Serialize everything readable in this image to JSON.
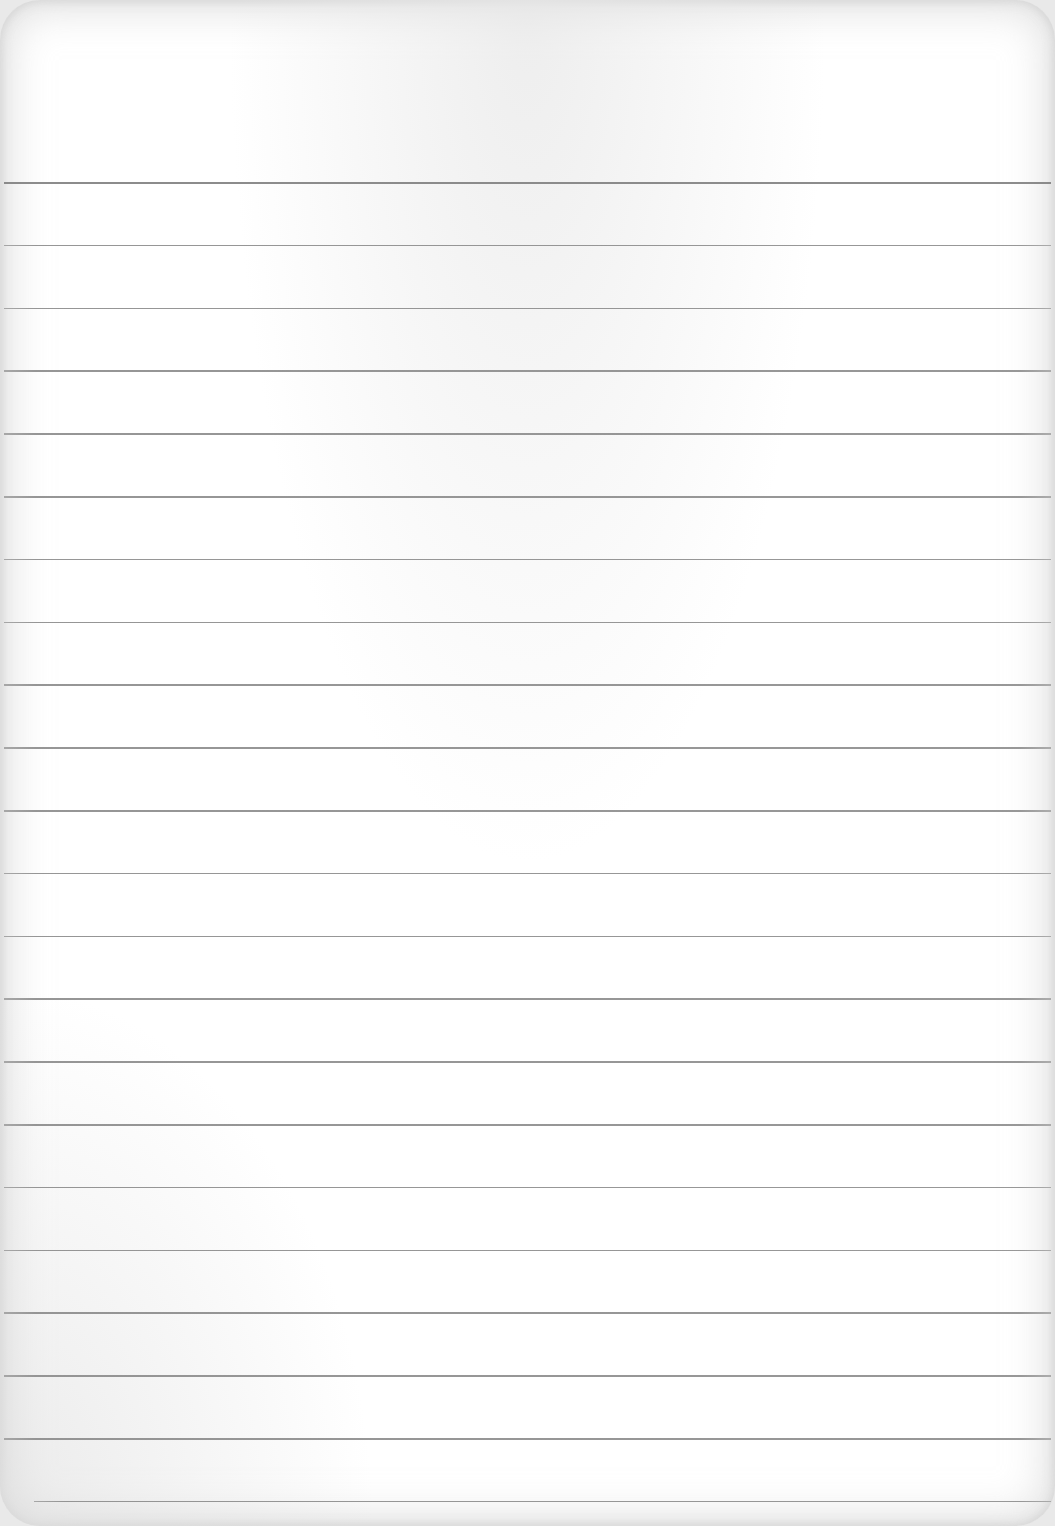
{
  "page": {
    "type": "ruled-paper",
    "background_color": "#ffffff",
    "line_color": "#8a8a8a",
    "line_count": 22,
    "first_line_y": 182,
    "line_spacing": 62.8
  }
}
